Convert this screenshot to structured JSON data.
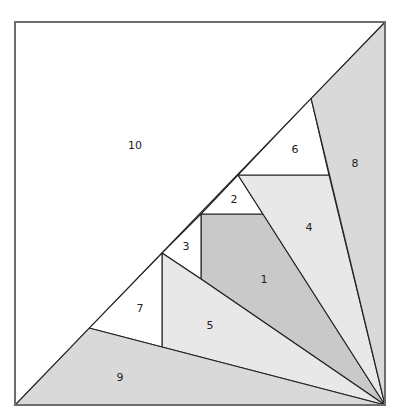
{
  "diagram": {
    "type": "foundation-paper-piecing-block",
    "frame": {
      "x": 15,
      "y": 22,
      "width": 370,
      "height": 383
    },
    "colors": {
      "white": "#ffffff",
      "light": "#e8e8e8",
      "medium": "#d9d9d9",
      "dark": "#c9c9c9",
      "line": "#222222",
      "border": "#6e6e6e"
    },
    "pieces": [
      {
        "id": "1",
        "label": "1",
        "fill": "#c9c9c9",
        "points": "201,214 263,214 385,405 201,279",
        "label_x": 264,
        "label_y": 279
      },
      {
        "id": "2",
        "label": "2",
        "fill": "#ffffff",
        "points": "238,175 263,214 201,214",
        "label_x": 234,
        "label_y": 199
      },
      {
        "id": "3",
        "label": "3",
        "fill": "#ffffff",
        "points": "201,214 201,279 162,253",
        "label_x": 186,
        "label_y": 246
      },
      {
        "id": "4",
        "label": "4",
        "fill": "#e8e8e8",
        "points": "238,175 329,175 385,405",
        "label_x": 309,
        "label_y": 227
      },
      {
        "id": "5",
        "label": "5",
        "fill": "#e8e8e8",
        "points": "162,253 201,279 385,405 162,347",
        "label_x": 210,
        "label_y": 325
      },
      {
        "id": "6",
        "label": "6",
        "fill": "#ffffff",
        "points": "311,98 329,175 238,175",
        "label_x": 295,
        "label_y": 149
      },
      {
        "id": "7",
        "label": "7",
        "fill": "#ffffff",
        "points": "162,253 162,347 89,328",
        "label_x": 140,
        "label_y": 308
      },
      {
        "id": "8",
        "label": "8",
        "fill": "#d9d9d9",
        "points": "385,22 385,405 311,98",
        "label_x": 355,
        "label_y": 163
      },
      {
        "id": "9",
        "label": "9",
        "fill": "#d9d9d9",
        "points": "89,328 385,405 15,405",
        "label_x": 120,
        "label_y": 377
      },
      {
        "id": "10",
        "label": "10",
        "fill": "#ffffff",
        "points": "15,22 385,22 15,405",
        "label_x": 135,
        "label_y": 145
      }
    ]
  }
}
